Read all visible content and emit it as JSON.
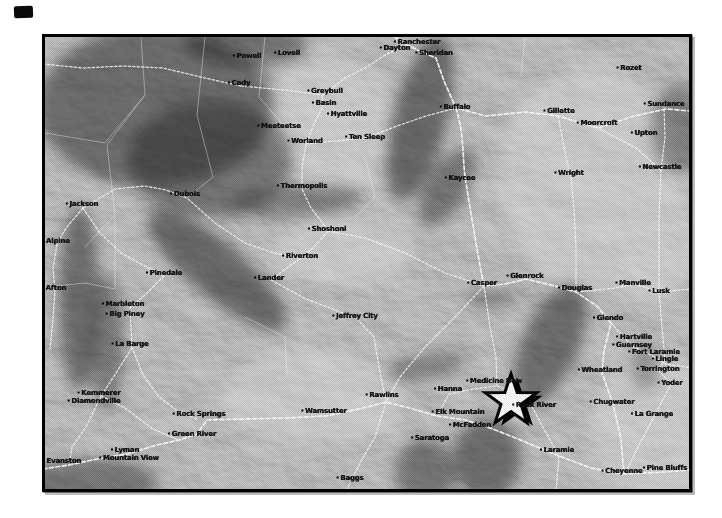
{
  "page": {
    "background": "#ffffff"
  },
  "artifact": {
    "present": true,
    "color": "#0a0a0a"
  },
  "map": {
    "kind": "shaded-relief-map",
    "frame_color": "#000000",
    "base_color": "#a6a6a6",
    "road_color": "#ffffff",
    "label_color": "#141414",
    "marker": {
      "shape": "star",
      "x": 466,
      "y": 364,
      "fill": "#ffffff",
      "outline": "#000000"
    },
    "towns": [
      {
        "name": "Powell",
        "x": 202,
        "y": 19
      },
      {
        "name": "Lovell",
        "x": 242,
        "y": 16
      },
      {
        "name": "Cody",
        "x": 194,
        "y": 46
      },
      {
        "name": "Greybull",
        "x": 280,
        "y": 54
      },
      {
        "name": "Basin",
        "x": 279,
        "y": 66
      },
      {
        "name": "Hyattville",
        "x": 302,
        "y": 77
      },
      {
        "name": "Meeteetse",
        "x": 234,
        "y": 89
      },
      {
        "name": "Worland",
        "x": 260,
        "y": 104
      },
      {
        "name": "Ten Sleep",
        "x": 320,
        "y": 100
      },
      {
        "name": "Thermopolis",
        "x": 257,
        "y": 149
      },
      {
        "name": "Dayton",
        "x": 350,
        "y": 11
      },
      {
        "name": "Ranchester",
        "x": 372,
        "y": 5
      },
      {
        "name": "Sheridan",
        "x": 389,
        "y": 16
      },
      {
        "name": "Buffalo",
        "x": 410,
        "y": 70
      },
      {
        "name": "Gillette",
        "x": 514,
        "y": 74
      },
      {
        "name": "Rozet",
        "x": 584,
        "y": 31
      },
      {
        "name": "Moorcroft",
        "x": 552,
        "y": 86
      },
      {
        "name": "Sundance",
        "x": 619,
        "y": 67
      },
      {
        "name": "Upton",
        "x": 599,
        "y": 96
      },
      {
        "name": "Newcastle",
        "x": 615,
        "y": 130
      },
      {
        "name": "Wright",
        "x": 524,
        "y": 136
      },
      {
        "name": "Kaycee",
        "x": 415,
        "y": 141
      },
      {
        "name": "Jackson",
        "x": 37,
        "y": 167
      },
      {
        "name": "Alpine",
        "x": 11,
        "y": 204
      },
      {
        "name": "Dubois",
        "x": 140,
        "y": 157
      },
      {
        "name": "Afton",
        "x": 9,
        "y": 251
      },
      {
        "name": "Pinedale",
        "x": 119,
        "y": 236
      },
      {
        "name": "Marbleton",
        "x": 78,
        "y": 267
      },
      {
        "name": "Big Piney",
        "x": 80,
        "y": 277
      },
      {
        "name": "La Barge",
        "x": 85,
        "y": 307
      },
      {
        "name": "Kemmerer",
        "x": 54,
        "y": 356
      },
      {
        "name": "Diamondville",
        "x": 49,
        "y": 364
      },
      {
        "name": "Evanston",
        "x": 17,
        "y": 424
      },
      {
        "name": "Lyman",
        "x": 80,
        "y": 413
      },
      {
        "name": "Mountain View",
        "x": 84,
        "y": 421
      },
      {
        "name": "Shoshoni",
        "x": 282,
        "y": 192
      },
      {
        "name": "Riverton",
        "x": 255,
        "y": 219
      },
      {
        "name": "Lander",
        "x": 224,
        "y": 241
      },
      {
        "name": "Jeffrey City",
        "x": 310,
        "y": 279
      },
      {
        "name": "Casper",
        "x": 437,
        "y": 246
      },
      {
        "name": "Glenrock",
        "x": 480,
        "y": 239
      },
      {
        "name": "Douglas",
        "x": 530,
        "y": 251
      },
      {
        "name": "Rawlins",
        "x": 337,
        "y": 358
      },
      {
        "name": "Wamsutter",
        "x": 279,
        "y": 374
      },
      {
        "name": "Rock Springs",
        "x": 154,
        "y": 377
      },
      {
        "name": "Green River",
        "x": 147,
        "y": 397
      },
      {
        "name": "Baggs",
        "x": 305,
        "y": 441
      },
      {
        "name": "Saratoga",
        "x": 385,
        "y": 401
      },
      {
        "name": "Hanna",
        "x": 403,
        "y": 352
      },
      {
        "name": "Elk Mountain",
        "x": 413,
        "y": 375
      },
      {
        "name": "McFadden",
        "x": 425,
        "y": 388
      },
      {
        "name": "Medicine Bow",
        "x": 449,
        "y": 344
      },
      {
        "name": "Rock River",
        "x": 489,
        "y": 368
      },
      {
        "name": "Laramie",
        "x": 512,
        "y": 413
      },
      {
        "name": "Lusk",
        "x": 614,
        "y": 254
      },
      {
        "name": "Manville",
        "x": 588,
        "y": 246
      },
      {
        "name": "Glendo",
        "x": 563,
        "y": 281
      },
      {
        "name": "Hartville",
        "x": 589,
        "y": 300
      },
      {
        "name": "Guernsey",
        "x": 587,
        "y": 308
      },
      {
        "name": "Fort Laramie",
        "x": 609,
        "y": 315
      },
      {
        "name": "Lingle",
        "x": 620,
        "y": 322
      },
      {
        "name": "Torrington",
        "x": 613,
        "y": 332
      },
      {
        "name": "Yoder",
        "x": 625,
        "y": 346
      },
      {
        "name": "Wheatland",
        "x": 555,
        "y": 333
      },
      {
        "name": "Chugwater",
        "x": 567,
        "y": 365
      },
      {
        "name": "La Grange",
        "x": 607,
        "y": 377
      },
      {
        "name": "Cheyenne",
        "x": 577,
        "y": 434
      },
      {
        "name": "Pine Bluffs",
        "x": 620,
        "y": 431
      }
    ]
  }
}
